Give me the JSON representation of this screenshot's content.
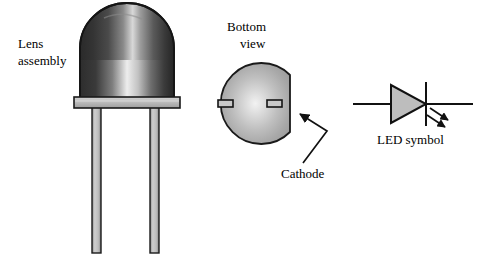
{
  "figure": {
    "background_color": "#ffffff",
    "outline_color": "#1a1a1a",
    "metal_fill": "#b8b8b8",
    "body_dark": "#2b2b2b",
    "body_highlight": "#e8e8e8"
  },
  "labels": {
    "lens_assembly_line1": "Lens",
    "lens_assembly_line2": "assembly",
    "bottom_view_line1": "Bottom",
    "bottom_view_line2": "view",
    "cathode": "Cathode",
    "led_symbol": "LED symbol"
  },
  "parts": {
    "side_view": {
      "name": "LED side view",
      "dome": "epoxy lens dome",
      "flange": "base flange",
      "lead_left": "anode lead",
      "lead_right": "cathode lead"
    },
    "bottom_view": {
      "name": "LED bottom view",
      "flat_edge": "cathode flat",
      "pad_left": "anode pad",
      "pad_right": "cathode pad"
    },
    "symbol": {
      "name": "LED schematic symbol",
      "triangle": "anode triangle",
      "bar": "cathode bar",
      "wire_left": "anode wire",
      "wire_right": "cathode wire",
      "emission_arrow_1": "light emission arrow",
      "emission_arrow_2": "light emission arrow"
    }
  }
}
